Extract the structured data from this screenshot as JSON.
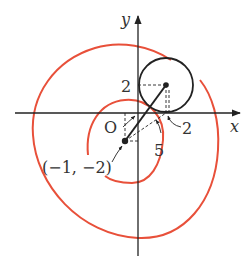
{
  "figure": {
    "type": "coordinate-diagram",
    "axes": {
      "x_label": "x",
      "y_label": "y",
      "origin_label": "O"
    },
    "circle": {
      "center_y_label": "2",
      "center_x_label": "2",
      "radius_note": "tangent to x-axis"
    },
    "point_label": "(−1, −2)",
    "distance_label": "5",
    "colors": {
      "spiral": "#e8503a",
      "ink": "#222222"
    }
  }
}
